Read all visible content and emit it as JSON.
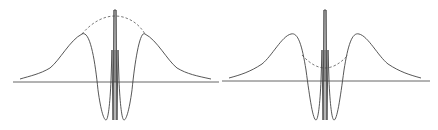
{
  "diagram": {
    "type": "wavefunction-envelope-comparison",
    "panels": [
      {
        "id": "left",
        "envelope_style": "dashed",
        "envelope_shape": "bell (convex, peaks above central spike)",
        "features": [
          "horizontal axis",
          "central double-line spike",
          "two side peaks",
          "two deep minima",
          "dashed envelope"
        ]
      },
      {
        "id": "right",
        "envelope_style": "dashed",
        "envelope_shape": "dip (concave, sags between side peaks)",
        "features": [
          "horizontal axis",
          "central double-line spike",
          "two side peaks",
          "two deep minima",
          "dashed envelope"
        ]
      }
    ],
    "colors": {
      "stroke": "#444444",
      "background": "#ffffff"
    }
  }
}
